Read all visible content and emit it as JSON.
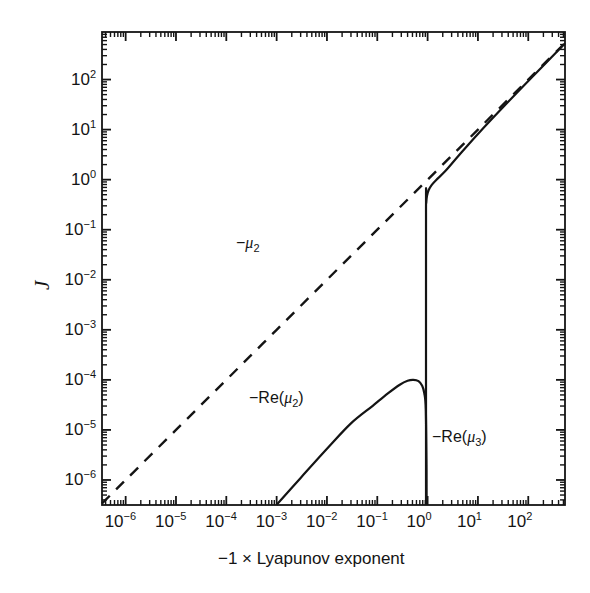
{
  "figure": {
    "background": "#ffffff",
    "ink_color": "#141414",
    "width": 590,
    "height": 593
  },
  "axes": {
    "x": {
      "title": "−1 × Lyapunov exponent",
      "scale": "log",
      "range": [
        -6.47,
        2.73
      ],
      "tick_exponents": [
        -6,
        -5,
        -4,
        -3,
        -2,
        -1,
        0,
        1,
        2
      ],
      "tick_labels": [
        "10−6",
        "10−5",
        "10−4",
        "10−3",
        "10−2",
        "10−1",
        "10⁰",
        "10¹",
        "10²"
      ],
      "minor_ticks": true
    },
    "y": {
      "title": "J",
      "scale": "log",
      "range": [
        -6.5,
        2.95
      ],
      "tick_exponents": [
        -6,
        -5,
        -4,
        -3,
        -2,
        -1,
        0,
        1,
        2
      ],
      "tick_labels": [
        "10−6",
        "10−5",
        "10−4",
        "10−3",
        "10−2",
        "10−1",
        "10⁰",
        "10¹",
        "10²"
      ],
      "minor_ticks": true
    }
  },
  "annotations": [
    {
      "name": "mu2-label",
      "text": "−μ₂",
      "x": 236,
      "y": 235
    },
    {
      "name": "re-mu2-label",
      "text": "−Re(μ₂)",
      "x": 249,
      "y": 390
    },
    {
      "name": "re-mu3-label",
      "text": "−Re(μ₃)",
      "x": 432,
      "y": 429
    }
  ],
  "chart_data": {
    "type": "line",
    "title": "",
    "xlabel": "−1 × Lyapunov exponent",
    "ylabel": "J",
    "xscale": "log",
    "yscale": "log",
    "xlim": [
      3.4e-07,
      540
    ],
    "ylim": [
      3.2e-07,
      890
    ],
    "grid": false,
    "legend": "inline-annotations",
    "series": [
      {
        "name": "−μ₂",
        "style": "dashed",
        "color": "#141414",
        "comment": "straight line of slope 1 on log-log: J = x",
        "x": [
          3.4e-07,
          1e-06,
          1e-05,
          0.0001,
          0.001,
          0.01,
          0.1,
          1,
          10,
          100,
          540
        ],
        "y": [
          3.4e-07,
          1e-06,
          1e-05,
          0.0001,
          0.001,
          0.01,
          0.1,
          1,
          10,
          100,
          540
        ]
      },
      {
        "name": "−Re(μ₃)",
        "style": "solid",
        "color": "#141414",
        "comment": "upper branch: drops vertically at x≈0.93 from J≈0.55 to below axis, then follows slope-1 asymptote above x≈1",
        "x": [
          0.93,
          0.93,
          0.94,
          0.97,
          1.05,
          1.2,
          1.5,
          2.2,
          4,
          10,
          40,
          150,
          540
        ],
        "y": [
          3.2e-07,
          0.22,
          0.34,
          0.47,
          0.62,
          0.78,
          1.0,
          1.45,
          2.9,
          8.2,
          36,
          142,
          530
        ]
      },
      {
        "name": "−Re(μ₂)",
        "style": "solid",
        "color": "#141414",
        "comment": "lower branch: rises from axis at x=1e-3 to peak J≈1.0e-4 near x≈0.45, then plunges at x≈0.95",
        "x": [
          0.001,
          0.003,
          0.01,
          0.03,
          0.08,
          0.16,
          0.28,
          0.4,
          0.52,
          0.66,
          0.78,
          0.86,
          0.92,
          0.95,
          0.955
        ],
        "y": [
          3.2e-07,
          1.1e-06,
          4.2e-06,
          1.35e-05,
          3e-05,
          5.3e-05,
          8e-05,
          9.6e-05,
          0.0001,
          9.4e-05,
          7.6e-05,
          5.4e-05,
          2.6e-05,
          2e-06,
          3.2e-07
        ]
      }
    ]
  }
}
